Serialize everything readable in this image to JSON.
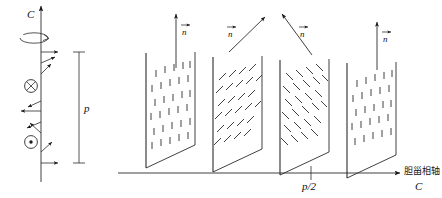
{
  "figure": {
    "title_visible": false,
    "domain_note": "cholesteric liquid crystal helical structure diagram",
    "colors": {
      "ink": "#1a1a1a",
      "stroke": "#2b2b2b",
      "background": "#ffffff"
    }
  },
  "left_panel": {
    "axis_label": "C",
    "pitch_label": "p",
    "rotation_arrow": "rotation-ellipse",
    "symbols": [
      {
        "name": "into-page",
        "glyph": "circle-cross"
      },
      {
        "name": "out-of-page",
        "glyph": "circle-dot"
      }
    ],
    "director_count": 9
  },
  "right_panel": {
    "axis_label_cjk": "胆甾相轴",
    "axis_label_latin": "C",
    "tick_label": "p/2",
    "panels": [
      {
        "index": 1,
        "n_label": "n",
        "arrow_angle_deg": 90,
        "hatch": "vertical"
      },
      {
        "index": 2,
        "n_label": "n",
        "arrow_angle_deg": 45,
        "hatch": "slash"
      },
      {
        "index": 3,
        "n_label": "n",
        "arrow_angle_deg": 135,
        "hatch": "backslash"
      },
      {
        "index": 4,
        "n_label": "n",
        "arrow_angle_deg": 90,
        "hatch": "vertical"
      }
    ]
  }
}
